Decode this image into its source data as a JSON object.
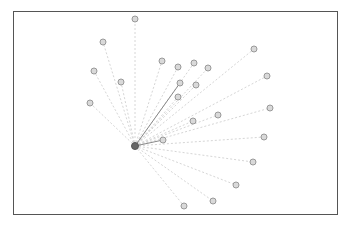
{
  "diagram": {
    "type": "star-graph",
    "frame": {
      "x": 13,
      "y": 11,
      "width": 324,
      "height": 203,
      "stroke": "#555555"
    },
    "colors": {
      "hub_fill": "#666666",
      "leaf_fill": "#d9d9d9",
      "leaf_stroke": "#999999",
      "dashed_edge": "#d6d6d6",
      "solid_edge": "#888888"
    },
    "hub": {
      "id": "hub",
      "x": 135,
      "y": 146,
      "r": 3.5
    },
    "leaf_radius": 3,
    "nodes": [
      {
        "id": "n1",
        "x": 135,
        "y": 19,
        "edge": "dashed"
      },
      {
        "id": "n2",
        "x": 103,
        "y": 42,
        "edge": "dashed"
      },
      {
        "id": "n3",
        "x": 94,
        "y": 71,
        "edge": "dashed"
      },
      {
        "id": "n4",
        "x": 121,
        "y": 82,
        "edge": "dashed"
      },
      {
        "id": "n5",
        "x": 90,
        "y": 103,
        "edge": "dashed"
      },
      {
        "id": "n6",
        "x": 162,
        "y": 61,
        "edge": "dashed"
      },
      {
        "id": "n7",
        "x": 178,
        "y": 67,
        "edge": "dashed"
      },
      {
        "id": "n8",
        "x": 194,
        "y": 63,
        "edge": "dashed"
      },
      {
        "id": "n9",
        "x": 208,
        "y": 68,
        "edge": "dashed"
      },
      {
        "id": "n10",
        "x": 180,
        "y": 83,
        "edge": "solid"
      },
      {
        "id": "n11",
        "x": 196,
        "y": 85,
        "edge": "dashed"
      },
      {
        "id": "n12",
        "x": 178,
        "y": 97,
        "edge": "dashed"
      },
      {
        "id": "n13",
        "x": 193,
        "y": 121,
        "edge": "dashed"
      },
      {
        "id": "n14",
        "x": 218,
        "y": 115,
        "edge": "dashed"
      },
      {
        "id": "n15",
        "x": 163,
        "y": 140,
        "edge": "solid"
      },
      {
        "id": "n16",
        "x": 254,
        "y": 49,
        "edge": "dashed"
      },
      {
        "id": "n17",
        "x": 267,
        "y": 76,
        "edge": "dashed"
      },
      {
        "id": "n18",
        "x": 270,
        "y": 108,
        "edge": "dashed"
      },
      {
        "id": "n19",
        "x": 264,
        "y": 137,
        "edge": "dashed"
      },
      {
        "id": "n20",
        "x": 253,
        "y": 162,
        "edge": "dashed"
      },
      {
        "id": "n21",
        "x": 236,
        "y": 185,
        "edge": "dashed"
      },
      {
        "id": "n22",
        "x": 213,
        "y": 201,
        "edge": "dashed"
      },
      {
        "id": "n23",
        "x": 184,
        "y": 206,
        "edge": "dashed"
      }
    ]
  }
}
